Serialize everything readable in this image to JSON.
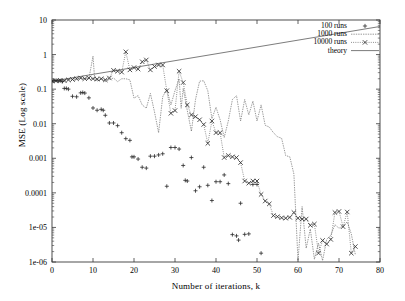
{
  "chart_data": {
    "type": "scatter",
    "title": "",
    "xlabel": "Number of iterations, k",
    "ylabel": "MSE (Log scale)",
    "xlim": [
      0,
      80
    ],
    "ylim": [
      1e-06,
      10
    ],
    "yscale": "log",
    "grid": false,
    "legend_position": "top-right",
    "xticks": [
      "0",
      "10",
      "20",
      "30",
      "40",
      "50",
      "60",
      "70",
      "80"
    ],
    "xtick_values": [
      0,
      10,
      20,
      30,
      40,
      50,
      60,
      70,
      80
    ],
    "yticks": [
      "1e-06",
      "1e-05",
      "0.0001",
      "0.001",
      "0.01",
      "0.1",
      "1",
      "10"
    ],
    "ytick_values": [
      1e-06,
      1e-05,
      0.0001,
      0.001,
      0.01,
      0.1,
      1,
      10
    ],
    "series": [
      {
        "name": "100 runs",
        "marker": "plus",
        "line": "none",
        "color": "#2b2b2b",
        "points": [
          [
            0,
            0.17
          ],
          [
            0.5,
            0.175
          ],
          [
            1,
            0.18
          ],
          [
            1.5,
            0.17
          ],
          [
            2,
            0.175
          ],
          [
            2.5,
            0.165
          ],
          [
            3,
            0.105
          ],
          [
            3.5,
            0.105
          ],
          [
            4,
            0.1
          ],
          [
            5,
            0.062
          ],
          [
            6,
            0.06
          ],
          [
            7,
            0.078
          ],
          [
            7.5,
            0.08
          ],
          [
            8,
            0.077
          ],
          [
            9,
            0.056
          ],
          [
            10,
            0.0285
          ],
          [
            11,
            0.0245
          ],
          [
            12,
            0.026
          ],
          [
            12.5,
            0.0245
          ],
          [
            13,
            0.0175
          ],
          [
            14,
            0.0105
          ],
          [
            15,
            0.0105
          ],
          [
            16,
            0.0088
          ],
          [
            17,
            0.0055
          ],
          [
            18,
            0.0037
          ],
          [
            19,
            0.0033
          ],
          [
            19.5,
            0.0011
          ],
          [
            20,
            0.0011
          ],
          [
            21,
            0.00095
          ],
          [
            22,
            0.00055
          ],
          [
            23,
            0.00052
          ],
          [
            24,
            0.00115
          ],
          [
            25,
            0.00115
          ],
          [
            26,
            0.00125
          ],
          [
            27,
            0.00135
          ],
          [
            28,
            0.000155
          ],
          [
            29,
            0.00205
          ],
          [
            30,
            0.00205
          ],
          [
            31,
            0.00185
          ],
          [
            32,
            0.00062
          ],
          [
            32.5,
            0.00023
          ],
          [
            33,
            0.00022
          ],
          [
            34,
            0.00105
          ],
          [
            35,
            0.000115
          ],
          [
            36,
            0.00015
          ],
          [
            37,
            0.00055
          ],
          [
            38,
            0.000165
          ],
          [
            39,
            6e-05
          ],
          [
            40,
            0.00021
          ],
          [
            41,
            0.00021
          ],
          [
            42,
            0.00033
          ],
          [
            43,
            0.000185
          ],
          [
            44,
            6.2e-06
          ],
          [
            45,
            5.7e-06
          ],
          [
            45.5,
            4.3e-06
          ],
          [
            46,
            5e-05
          ],
          [
            47,
            6.3e-06
          ],
          [
            48,
            6.5e-06
          ],
          [
            49,
            0.000175
          ],
          [
            50,
            0.000175
          ],
          [
            51,
            1.8e-06
          ]
        ]
      },
      {
        "name": "1000 runs",
        "marker": "none",
        "line": "solid-thin",
        "color": "#555555",
        "points": [
          [
            0,
            0.17
          ],
          [
            1,
            0.18
          ],
          [
            2,
            0.19
          ],
          [
            3,
            0.185
          ],
          [
            4,
            0.195
          ],
          [
            5,
            0.2
          ],
          [
            6,
            0.2
          ],
          [
            7,
            0.21
          ],
          [
            8,
            0.2
          ],
          [
            9,
            0.2
          ],
          [
            10,
            0.9
          ],
          [
            10.4,
            0.2
          ],
          [
            11,
            0.17
          ],
          [
            12,
            0.2
          ],
          [
            13,
            0.165
          ],
          [
            14,
            0.19
          ],
          [
            15,
            0.21
          ],
          [
            16,
            0.165
          ],
          [
            17,
            0.2
          ],
          [
            18,
            0.2
          ],
          [
            19,
            0.185
          ],
          [
            20,
            0.055
          ],
          [
            21,
            0.065
          ],
          [
            22,
            0.035
          ],
          [
            23,
            0.028
          ],
          [
            24,
            0.075
          ],
          [
            25,
            0.022
          ],
          [
            26,
            0.0055
          ],
          [
            27,
            0.06
          ],
          [
            28,
            0.1
          ],
          [
            29,
            0.035
          ],
          [
            30,
            0.09
          ],
          [
            31,
            0.2
          ],
          [
            31.5,
            0.028
          ],
          [
            32,
            0.105
          ],
          [
            33,
            0.024
          ],
          [
            34,
            0.006
          ],
          [
            35,
            0.05
          ],
          [
            36,
            0.17
          ],
          [
            37,
            0.175
          ],
          [
            38,
            0.09
          ],
          [
            39,
            0.014
          ],
          [
            40,
            0.03
          ],
          [
            41,
            0.013
          ],
          [
            42,
            0.004
          ],
          [
            43,
            0.012
          ],
          [
            44,
            0.05
          ],
          [
            45,
            0.065
          ],
          [
            46,
            0.012
          ],
          [
            47,
            0.05
          ],
          [
            48,
            0.018
          ],
          [
            49,
            0.045
          ],
          [
            50,
            0.012
          ],
          [
            51,
            0.035
          ],
          [
            52,
            0.009
          ],
          [
            53,
            0.008
          ],
          [
            54,
            0.0055
          ],
          [
            55,
            0.0042
          ],
          [
            56,
            0.0038
          ],
          [
            57,
            0.0012
          ],
          [
            58,
            0.0011
          ],
          [
            59,
            0.00035
          ],
          [
            60,
            1.1e-06
          ],
          [
            61,
            4e-05
          ],
          [
            62,
            2.5e-06
          ],
          [
            63,
            9e-06
          ],
          [
            64,
            1.2e-06
          ],
          [
            65,
            3.5e-06
          ],
          [
            66,
            1.1e-06
          ],
          [
            67,
            4.5e-06
          ],
          [
            68,
            6e-06
          ],
          [
            69,
            1.2e-05
          ],
          [
            70,
            9.5e-06
          ],
          [
            71,
            1.1e-05
          ],
          [
            72,
            1.45e-05
          ],
          [
            73,
            6.5e-06
          ],
          [
            74,
            1.6e-06
          ]
        ]
      },
      {
        "name": "10000 runs",
        "marker": "cross",
        "line": "dotted",
        "color": "#333333",
        "points": [
          [
            0,
            0.17
          ],
          [
            1,
            0.175
          ],
          [
            2,
            0.18
          ],
          [
            3,
            0.175
          ],
          [
            4,
            0.185
          ],
          [
            5,
            0.19
          ],
          [
            6,
            0.2
          ],
          [
            7,
            0.21
          ],
          [
            8,
            0.2
          ],
          [
            9,
            0.21
          ],
          [
            10,
            0.2
          ],
          [
            11,
            0.195
          ],
          [
            12,
            0.2
          ],
          [
            13,
            0.185
          ],
          [
            14,
            0.21
          ],
          [
            15,
            0.35
          ],
          [
            16,
            0.33
          ],
          [
            17,
            0.31
          ],
          [
            18,
            1.2
          ],
          [
            19,
            0.36
          ],
          [
            20,
            0.42
          ],
          [
            21,
            0.38
          ],
          [
            22,
            0.62
          ],
          [
            23,
            0.7
          ],
          [
            24,
            0.36
          ],
          [
            25,
            0.45
          ],
          [
            26,
            0.5
          ],
          [
            27,
            0.5
          ],
          [
            28,
            0.09
          ],
          [
            29,
            0.02
          ],
          [
            30,
            0.024
          ],
          [
            31,
            0.33
          ],
          [
            32,
            0.155
          ],
          [
            33,
            0.035
          ],
          [
            34,
            0.018
          ],
          [
            35,
            0.016
          ],
          [
            36,
            0.013
          ],
          [
            37,
            0.0095
          ],
          [
            38,
            0.0027
          ],
          [
            39,
            0.012
          ],
          [
            40,
            0.0055
          ],
          [
            41,
            0.0055
          ],
          [
            42,
            0.00105
          ],
          [
            43,
            0.0012
          ],
          [
            44,
            0.0011
          ],
          [
            45,
            0.00105
          ],
          [
            46,
            0.00075
          ],
          [
            47,
            0.00022
          ],
          [
            48,
            0.00019
          ],
          [
            49,
            0.00022
          ],
          [
            50,
            0.00022
          ],
          [
            51,
            9e-05
          ],
          [
            52,
            5.8e-05
          ],
          [
            53,
            4.8e-05
          ],
          [
            54,
            2.2e-05
          ],
          [
            55,
            2.05e-05
          ],
          [
            56,
            1.9e-05
          ],
          [
            57,
            1.85e-05
          ],
          [
            58,
            1.95e-05
          ],
          [
            59,
            2.7e-05
          ],
          [
            60,
            1.85e-05
          ],
          [
            61,
            1.75e-05
          ],
          [
            62,
            1.75e-05
          ],
          [
            63,
            1.15e-05
          ],
          [
            64,
            1.25e-05
          ],
          [
            65,
            1.8e-06
          ],
          [
            66,
            4.2e-06
          ],
          [
            67,
            3.3e-06
          ],
          [
            68,
            4.5e-06
          ],
          [
            69,
            2.7e-05
          ],
          [
            70,
            2.9e-05
          ],
          [
            71,
            1.05e-05
          ],
          [
            72,
            2.8e-05
          ],
          [
            73,
            1.8e-06
          ],
          [
            74,
            2.8e-06
          ]
        ]
      },
      {
        "name": "theory",
        "marker": "none",
        "line": "solid",
        "color": "#444444",
        "points": [
          [
            0,
            0.17
          ],
          [
            80,
            6.5
          ]
        ]
      }
    ]
  },
  "legend": {
    "entries": [
      {
        "label": "100 runs",
        "sample": "plus-marker"
      },
      {
        "label": "1000 runs",
        "sample": "dashed-line"
      },
      {
        "label": "10000 runs",
        "sample": "dotted-cross-line"
      },
      {
        "label": "theory",
        "sample": "solid-line"
      }
    ]
  },
  "colors": {
    "background": "#ffffff",
    "axis": "#3a3a3a",
    "text": "#000000",
    "series_100": "#2b2b2b",
    "series_1000": "#555555",
    "series_10000": "#333333",
    "series_theory": "#444444"
  }
}
